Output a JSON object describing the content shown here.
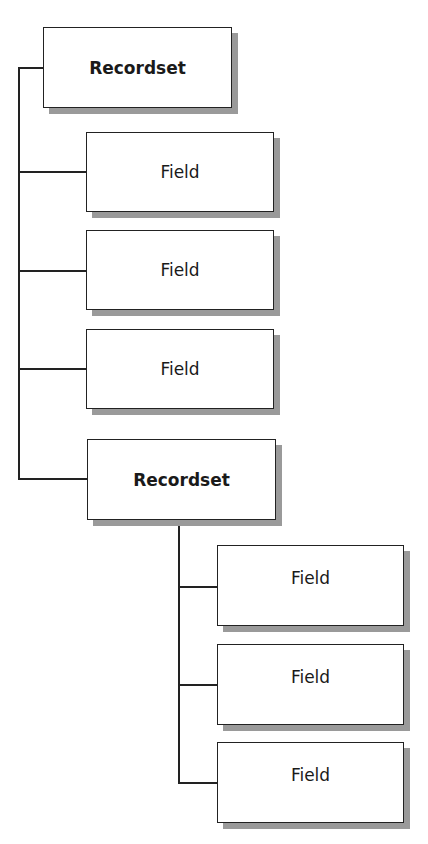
{
  "diagram": {
    "root": {
      "label": "Recordset"
    },
    "level1": [
      {
        "label": "Field"
      },
      {
        "label": "Field"
      },
      {
        "label": "Field"
      },
      {
        "label": "Recordset"
      }
    ],
    "level2": [
      {
        "label": "Field"
      },
      {
        "label": "Field"
      },
      {
        "label": "Field"
      }
    ]
  }
}
